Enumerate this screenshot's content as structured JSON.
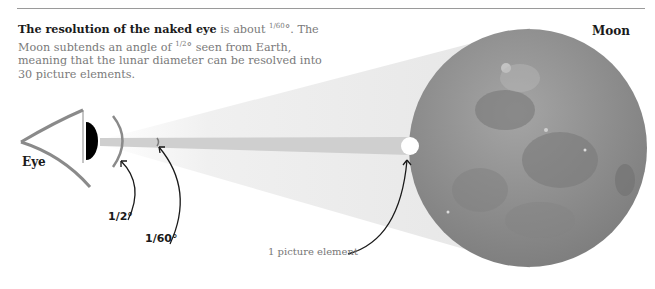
{
  "caption": {
    "bold": "The resolution of the naked eye",
    "rest_1": " is about ",
    "fraction_1": "1/60",
    "degree_1": "°.",
    "line_2": " The Moon subtends an angle of ",
    "fraction_2": "1/2",
    "line_2_rest": "° seen from Earth, meaning that the lunar diameter can be resolved into 30 picture elements."
  },
  "labels": {
    "eye": "Eye",
    "moon": "Moon",
    "half_degree": "1/2°",
    "sixtieth_degree": "1/60°",
    "picture_element": "1 picture element"
  },
  "colors": {
    "cone": "#ebebeb",
    "beam": "#cfcfcf",
    "moon": "#8f8f8f",
    "eye_line": "#8a8a8a",
    "arrow": "#1a1a1a"
  }
}
